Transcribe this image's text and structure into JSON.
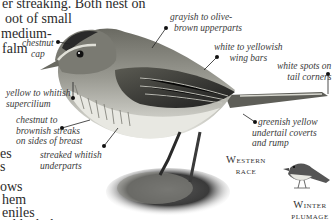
{
  "species_text": {
    "lines": [
      "er streaking. Both nest on",
      "oot of small",
      "medium-",
      "falm",
      "es",
      "s",
      "ows",
      "hem",
      "eniles",
      "nd lack the"
    ]
  },
  "labels": {
    "chestnut_cap": [
      "chestnut",
      "cap"
    ],
    "upperparts": [
      "grayish to olive-",
      "brown upperparts"
    ],
    "wing_bars": [
      "white to yellowish",
      "wing bars"
    ],
    "tail_corners": [
      "white spots on",
      "tail corners"
    ],
    "supercilium": [
      "yellow to whitish",
      "supercilium"
    ],
    "breast_streaks": [
      "chestnut to",
      "brownish streaks",
      "on sides of breast"
    ],
    "underparts": [
      "streaked whitish",
      "underparts"
    ],
    "undertail": [
      "greenish yellow",
      "undertail coverts",
      "and rump"
    ]
  },
  "captions": {
    "western_race": {
      "line1": "Western",
      "line2": "race"
    },
    "winter_plumage": {
      "line1": "Winter",
      "line2": "plumage"
    }
  },
  "colors": {
    "leader_line": "#222222",
    "text": "#2b2b2b"
  }
}
